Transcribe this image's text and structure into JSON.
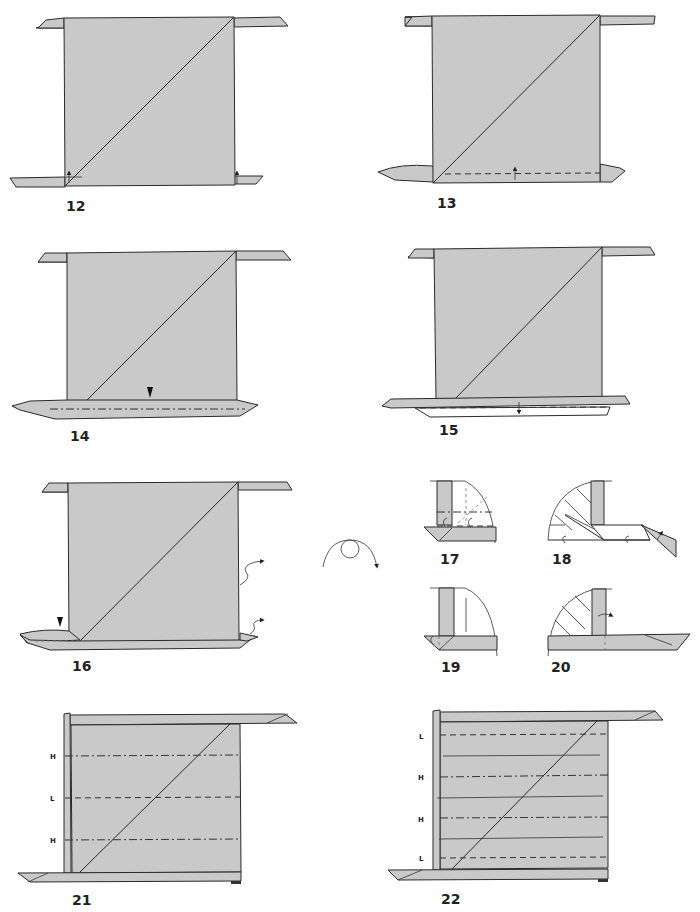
{
  "diagram": {
    "colors": {
      "paper": "#c9c9c9",
      "line": "#2a2a2a",
      "background": "#ffffff"
    },
    "steps": [
      {
        "number": "12",
        "description": "square with diagonal, small flaps; little arrows at bottom corners"
      },
      {
        "number": "13",
        "description": "valley fold along bottom edge"
      },
      {
        "number": "14",
        "description": "mountain fold with push indicator"
      },
      {
        "number": "15",
        "description": "fold down the bottom strip"
      },
      {
        "number": "16",
        "description": "push indicator; unfold arrows on right"
      },
      {
        "number": "17",
        "description": "detail: corner with x-ray lines"
      },
      {
        "number": "18",
        "description": "detail: fold corner flap"
      },
      {
        "number": "19",
        "description": "detail: corner tucked"
      },
      {
        "number": "20",
        "description": "detail: fold strip across"
      },
      {
        "number": "21",
        "description": "crease lines labeled H, L, H"
      },
      {
        "number": "22",
        "description": "crease lines labeled L, H, H, L"
      }
    ],
    "turnover_symbol": "turn-over-icon",
    "step21_crease_labels": [
      "H",
      "L",
      "H"
    ],
    "step22_crease_labels": [
      "L",
      "H",
      "H",
      "L"
    ]
  }
}
